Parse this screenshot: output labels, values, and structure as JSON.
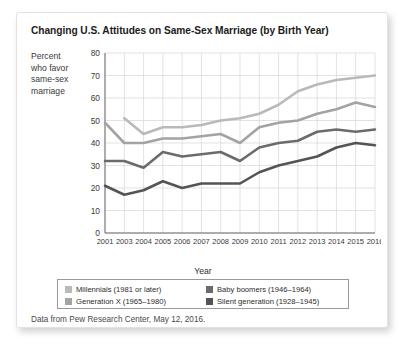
{
  "card": {
    "title": "Changing U.S. Attitudes on Same-Sex Marriage (by Birth Year)",
    "source_note": "Data from Pew Research Center, May 12, 2016.",
    "ylabel_lines": [
      "Percent",
      "who favor",
      "same-sex",
      "marriage"
    ],
    "xlabel": "Year"
  },
  "chart_data": {
    "type": "line",
    "title": "Changing U.S. Attitudes on Same-Sex Marriage (by Birth Year)",
    "xlabel": "Year",
    "ylabel": "Percent who favor same-sex marriage",
    "categories": [
      "2001",
      "2003",
      "2004",
      "2005",
      "2006",
      "2007",
      "2008",
      "2009",
      "2010",
      "2011",
      "2012",
      "2013",
      "2014",
      "2015",
      "2016"
    ],
    "x": [
      2001,
      2003,
      2004,
      2005,
      2006,
      2007,
      2008,
      2009,
      2010,
      2011,
      2012,
      2013,
      2014,
      2015,
      2016
    ],
    "xlim": [
      2001,
      2016
    ],
    "ylim": [
      0,
      80
    ],
    "yticks": [
      0,
      10,
      20,
      30,
      40,
      50,
      60,
      70,
      80
    ],
    "grid": true,
    "legend_position": "below-axes",
    "series": [
      {
        "name": "Millennials (1981 or later)",
        "color": "#b9b9b9",
        "values": [
          null,
          51,
          44,
          47,
          47,
          48,
          50,
          51,
          53,
          57,
          63,
          66,
          68,
          69,
          70
        ]
      },
      {
        "name": "Generation X (1965–1980)",
        "color": "#a3a3a3",
        "values": [
          49,
          40,
          40,
          42,
          42,
          43,
          44,
          40,
          47,
          49,
          50,
          53,
          55,
          58,
          56
        ]
      },
      {
        "name": "Baby boomers (1946–1964)",
        "color": "#6b6b6b",
        "values": [
          32,
          32,
          29,
          36,
          34,
          35,
          36,
          32,
          38,
          40,
          41,
          45,
          46,
          45,
          46
        ]
      },
      {
        "name": "Silent generation (1928–1945)",
        "color": "#545454",
        "values": [
          21,
          17,
          19,
          23,
          20,
          22,
          22,
          22,
          27,
          30,
          32,
          34,
          38,
          40,
          39
        ]
      }
    ]
  },
  "legend": {
    "left_column": [
      {
        "label": "Millennials (1981 or later)",
        "color": "#b9b9b9"
      },
      {
        "label": "Generation X (1965–1980)",
        "color": "#a3a3a3"
      }
    ],
    "right_column": [
      {
        "label": "Baby boomers (1946–1964)",
        "color": "#6b6b6b"
      },
      {
        "label": "Silent generation (1928–1945)",
        "color": "#545454"
      }
    ]
  }
}
